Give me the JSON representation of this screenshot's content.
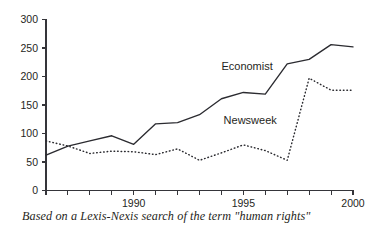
{
  "chart_data": {
    "type": "line",
    "title": "",
    "subtitle": "",
    "caption": "Based on a Lexis-Nexis search of the term \"human rights\"",
    "xlabel": "",
    "ylabel": "",
    "xlim": [
      1986,
      2000
    ],
    "ylim": [
      0,
      300
    ],
    "grid": false,
    "legend_position": "inline-annotation",
    "yticks": [
      0,
      50,
      100,
      150,
      200,
      250,
      300
    ],
    "ytick_labels": [
      "0",
      "50",
      "100",
      "150",
      "200",
      "250",
      "300"
    ],
    "xticks": [
      1986,
      1987,
      1988,
      1989,
      1990,
      1991,
      1992,
      1993,
      1994,
      1995,
      1996,
      1997,
      1998,
      1999,
      2000
    ],
    "xtick_labels_shown": [
      "1990",
      "1995",
      "2000"
    ],
    "xtick_labels_shown_values": [
      1990,
      1995,
      2000
    ],
    "x": [
      1986,
      1987,
      1988,
      1989,
      1990,
      1991,
      1992,
      1993,
      1994,
      1995,
      1996,
      1997,
      1998,
      1999,
      2000
    ],
    "series": [
      {
        "name": "Economist",
        "style": "solid",
        "label_x": 1994.0,
        "label_y": 212,
        "values": [
          62,
          78,
          87,
          96,
          81,
          117,
          119,
          133,
          161,
          172,
          169,
          222,
          230,
          256,
          252
        ]
      },
      {
        "name": "Newsweek",
        "style": "dotted",
        "label_x": 1994.1,
        "label_y": 117,
        "values": [
          87,
          78,
          65,
          69,
          68,
          63,
          73,
          53,
          66,
          80,
          70,
          53,
          197,
          176,
          176
        ]
      }
    ],
    "annotations": [
      {
        "text": "Economist",
        "series": "Economist"
      },
      {
        "text": "Newsweek",
        "series": "Newsweek"
      }
    ]
  }
}
